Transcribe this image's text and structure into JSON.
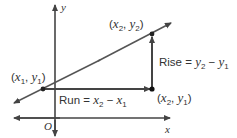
{
  "diagram": {
    "type": "slope-rise-run",
    "axes": {
      "x_label": "x",
      "y_label": "y",
      "origin_label": "O"
    },
    "points": {
      "p1": {
        "label": "(x1, y1)",
        "x_var": "x",
        "x_sub": "1",
        "y_var": "y",
        "y_sub": "1"
      },
      "p2": {
        "label": "(x2, y2)",
        "x_var": "x",
        "x_sub": "2",
        "y_var": "y",
        "y_sub": "2"
      },
      "p3": {
        "label": "(x2, y1)",
        "x_var": "x",
        "x_sub": "2",
        "y_var": "y",
        "y_sub": "1"
      }
    },
    "rise": {
      "word": "Rise",
      "equals": " = ",
      "a_var": "y",
      "a_sub": "2",
      "minus": " − ",
      "b_var": "y",
      "b_sub": "1",
      "text": "Rise = y2 − y1"
    },
    "run": {
      "word": "Run",
      "equals": " = ",
      "a_var": "x",
      "a_sub": "2",
      "minus": " − ",
      "b_var": "x",
      "b_sub": "1",
      "text": "Run = x2 − x1"
    },
    "colors": {
      "line": "#444444",
      "accent_fill": "#d9534f",
      "text": "#333333"
    }
  }
}
